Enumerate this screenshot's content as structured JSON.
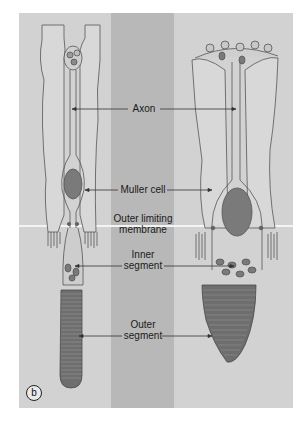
{
  "figure": {
    "panel_label": "b",
    "colors": {
      "background": "#d2d2d2",
      "center_band": "#b8b8b8",
      "membrane_line": "#f4f4f4",
      "outline": "#555555",
      "nucleus": "#7a7a7a",
      "outer_segment": "#6e6e6e"
    },
    "cells": [
      {
        "name": "rod",
        "position": "left"
      },
      {
        "name": "cone",
        "position": "right"
      }
    ],
    "labels": {
      "axon": "Axon",
      "muller_cell": "Muller cell",
      "outer_limiting_membrane_line1": "Outer limiting",
      "outer_limiting_membrane_line2": "membrane",
      "inner_segment_line1": "Inner",
      "inner_segment_line2": "segment",
      "outer_segment_line1": "Outer",
      "outer_segment_line2": "segment"
    }
  }
}
